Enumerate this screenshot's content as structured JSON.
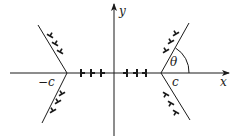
{
  "diagram": {
    "axes": {
      "x_label": "x",
      "y_label": "y"
    },
    "points": {
      "left_label": "−c",
      "right_label": "c"
    },
    "angle_label": "θ",
    "colors": {
      "line": "#1a1a1a",
      "background": "#ffffff"
    },
    "dislocations": {
      "x_axis_left_count": 3,
      "x_axis_right_count": 3,
      "left_upper_count": 3,
      "left_lower_count": 3,
      "right_upper_count": 3,
      "right_lower_count": 3
    }
  }
}
